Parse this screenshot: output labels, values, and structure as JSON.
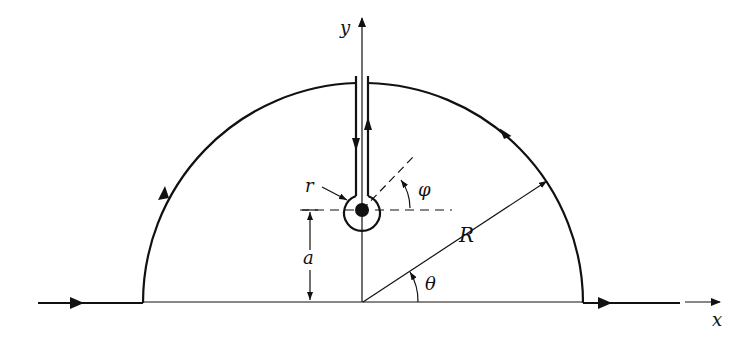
{
  "diagram": {
    "labels": {
      "y_axis": "y",
      "x_axis": "x",
      "small_radius": "r",
      "phi_angle": "φ",
      "height": "a",
      "big_radius": "R",
      "theta_angle": "θ"
    },
    "colors": {
      "stroke": "#111111",
      "background": "#ffffff"
    }
  }
}
